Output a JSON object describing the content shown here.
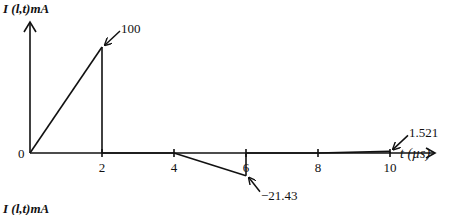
{
  "chart_data": {
    "type": "line",
    "title": "",
    "ylabel": "I (l,t)mA",
    "xlabel": "t (µs)",
    "origin_label": "0",
    "x_ticks": [
      2,
      4,
      6,
      8,
      10
    ],
    "x_tick_labels": [
      "2",
      "4",
      "6",
      "8",
      "10"
    ],
    "xlim": [
      0,
      11.5
    ],
    "ylim": [
      -30,
      120
    ],
    "grid": false,
    "series": [
      {
        "name": "I(l,t)",
        "points": [
          [
            0,
            0
          ],
          [
            2,
            100
          ],
          [
            2,
            0
          ],
          [
            4,
            0
          ],
          [
            6,
            -21.43
          ],
          [
            6,
            0
          ],
          [
            8,
            0
          ],
          [
            10,
            1.521
          ],
          [
            10,
            0
          ]
        ]
      }
    ],
    "annotations": [
      {
        "text": "100",
        "x": 2,
        "y": 100,
        "arrow_dir": "upper-right"
      },
      {
        "text": "−21.43",
        "x": 6,
        "y": -21.43,
        "arrow_dir": "lower-right"
      },
      {
        "text": "1.521",
        "x": 10,
        "y": 1.521,
        "arrow_dir": "upper-right"
      }
    ],
    "next_panel_ylabel": "I (l,t)mA"
  }
}
